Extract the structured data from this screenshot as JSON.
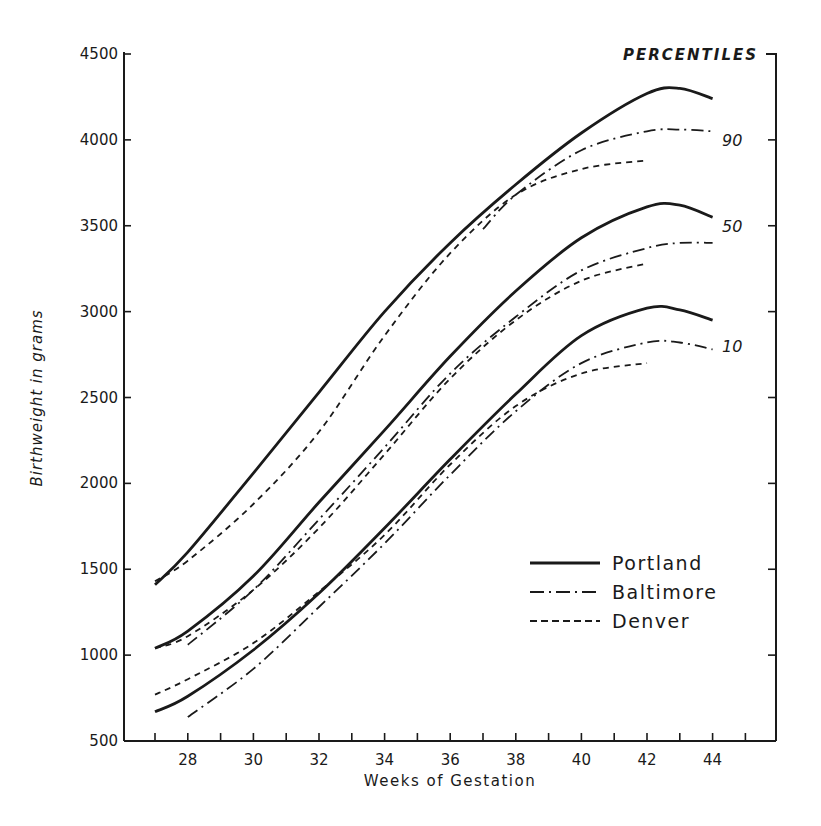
{
  "chart_data": {
    "type": "line",
    "title": "",
    "xlabel": "Weeks of Gestation",
    "ylabel": "Birthweight in grams",
    "xlim": [
      26,
      46
    ],
    "ylim": [
      500,
      4500
    ],
    "xticks": [
      27,
      28,
      29,
      30,
      31,
      32,
      33,
      34,
      35,
      36,
      37,
      38,
      39,
      40,
      41,
      42,
      43,
      44,
      45
    ],
    "xtick_labels": [
      "28",
      "30",
      "32",
      "34",
      "36",
      "38",
      "40",
      "42",
      "44"
    ],
    "xtick_label_values": [
      28,
      30,
      32,
      34,
      36,
      38,
      40,
      42,
      44
    ],
    "yticks": [
      500,
      1000,
      1500,
      2000,
      2500,
      3000,
      3500,
      4000,
      4500
    ],
    "ytick_labels": [
      "500",
      "1000",
      "1500",
      "2000",
      "2500",
      "3000",
      "3500",
      "4000",
      "4500"
    ],
    "grid": false,
    "percentile_header": "PERCENTILES",
    "percentile_labels": [
      {
        "text": "90",
        "value": 4000
      },
      {
        "text": "50",
        "value": 3500
      },
      {
        "text": "10",
        "value": 2800
      }
    ],
    "legend": {
      "placement": "bottom-right",
      "entries": [
        {
          "name": "Portland",
          "style": "solid"
        },
        {
          "name": "Baltimore",
          "style": "dash-dot"
        },
        {
          "name": "Denver",
          "style": "dashed"
        }
      ]
    },
    "series": [
      {
        "name": "Portland",
        "percentile": "90",
        "style": "solid",
        "x": [
          27,
          28,
          30,
          32,
          34,
          36,
          38,
          40,
          42,
          43,
          44
        ],
        "y": [
          1410,
          1600,
          2060,
          2530,
          3000,
          3400,
          3740,
          4040,
          4270,
          4300,
          4240
        ]
      },
      {
        "name": "Baltimore",
        "percentile": "90",
        "style": "dash-dot",
        "x": [
          37,
          38,
          40,
          42,
          43,
          44
        ],
        "y": [
          3480,
          3680,
          3940,
          4050,
          4060,
          4050
        ]
      },
      {
        "name": "Denver",
        "percentile": "90",
        "style": "dashed",
        "x": [
          27,
          28,
          30,
          32,
          34,
          36,
          38,
          40,
          42
        ],
        "y": [
          1430,
          1550,
          1880,
          2300,
          2860,
          3340,
          3680,
          3830,
          3880
        ]
      },
      {
        "name": "Portland",
        "percentile": "50",
        "style": "solid",
        "x": [
          27,
          28,
          30,
          32,
          34,
          36,
          38,
          40,
          42,
          43,
          44
        ],
        "y": [
          1040,
          1140,
          1460,
          1890,
          2310,
          2740,
          3120,
          3430,
          3610,
          3620,
          3550
        ]
      },
      {
        "name": "Baltimore",
        "percentile": "50",
        "style": "dash-dot",
        "x": [
          28,
          30,
          32,
          34,
          36,
          38,
          40,
          42,
          43,
          44
        ],
        "y": [
          1060,
          1380,
          1790,
          2210,
          2640,
          2970,
          3240,
          3370,
          3400,
          3400
        ]
      },
      {
        "name": "Denver",
        "percentile": "50",
        "style": "dashed",
        "x": [
          27,
          28,
          30,
          32,
          34,
          36,
          38,
          40,
          42
        ],
        "y": [
          1040,
          1110,
          1380,
          1740,
          2170,
          2610,
          2950,
          3180,
          3280
        ]
      },
      {
        "name": "Portland",
        "percentile": "10",
        "style": "solid",
        "x": [
          27,
          28,
          30,
          32,
          34,
          36,
          38,
          40,
          42,
          43,
          44
        ],
        "y": [
          670,
          760,
          1030,
          1360,
          1740,
          2140,
          2520,
          2860,
          3020,
          3010,
          2950
        ]
      },
      {
        "name": "Baltimore",
        "percentile": "10",
        "style": "dash-dot",
        "x": [
          28,
          30,
          32,
          34,
          36,
          38,
          40,
          42,
          43,
          44
        ],
        "y": [
          640,
          920,
          1280,
          1650,
          2050,
          2420,
          2700,
          2820,
          2820,
          2780
        ]
      },
      {
        "name": "Denver",
        "percentile": "10",
        "style": "dashed",
        "x": [
          27,
          28,
          30,
          32,
          34,
          36,
          38,
          40,
          42
        ],
        "y": [
          770,
          860,
          1070,
          1370,
          1700,
          2110,
          2450,
          2640,
          2700
        ]
      }
    ]
  }
}
